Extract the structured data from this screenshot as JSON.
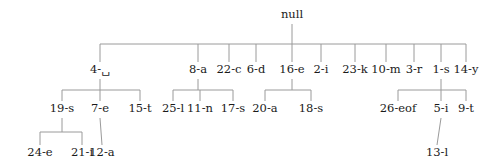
{
  "tree": {
    "line_color": "#9a9a9a",
    "text_color": "#1a1a1a",
    "root": {
      "label": "null",
      "x": 292,
      "y": 15,
      "children": [
        {
          "label": "4-␣",
          "x": 100,
          "y": 70,
          "children": [
            {
              "label": "19-s",
              "x": 62,
              "y": 109,
              "children": [
                {
                  "label": "24-e",
                  "x": 40,
                  "y": 153,
                  "children": []
                },
                {
                  "label": "21-i",
                  "x": 82,
                  "y": 153,
                  "children": []
                }
              ]
            },
            {
              "label": "7-e",
              "x": 100,
              "y": 109,
              "children": [
                {
                  "label": "12-a",
                  "x": 102,
                  "y": 153,
                  "children": []
                }
              ]
            },
            {
              "label": "15-t",
              "x": 140,
              "y": 109,
              "children": []
            }
          ]
        },
        {
          "label": "8-a",
          "x": 198,
          "y": 70,
          "children": [
            {
              "label": "25-l",
              "x": 173,
              "y": 109,
              "children": []
            },
            {
              "label": "11-n",
              "x": 200,
              "y": 109,
              "children": []
            },
            {
              "label": "17-s",
              "x": 233,
              "y": 109,
              "children": []
            }
          ]
        },
        {
          "label": "22-c",
          "x": 229,
          "y": 70,
          "children": []
        },
        {
          "label": "6-d",
          "x": 256,
          "y": 70,
          "children": []
        },
        {
          "label": "16-e",
          "x": 292,
          "y": 70,
          "children": [
            {
              "label": "20-a",
              "x": 265,
              "y": 109,
              "children": []
            },
            {
              "label": "18-s",
              "x": 311,
              "y": 109,
              "children": []
            }
          ]
        },
        {
          "label": "2-i",
          "x": 321,
          "y": 70,
          "children": []
        },
        {
          "label": "23-k",
          "x": 355,
          "y": 70,
          "children": []
        },
        {
          "label": "10-m",
          "x": 386,
          "y": 70,
          "children": []
        },
        {
          "label": "3-r",
          "x": 414,
          "y": 70,
          "children": []
        },
        {
          "label": "1-s",
          "x": 441,
          "y": 70,
          "children": [
            {
              "label": "26-eof",
              "x": 398,
              "y": 109,
              "children": []
            },
            {
              "label": "5-i",
              "x": 441,
              "y": 109,
              "children": [
                {
                  "label": "13-l",
                  "x": 437,
                  "y": 153,
                  "children": []
                }
              ]
            },
            {
              "label": "9-t",
              "x": 466,
              "y": 109,
              "children": []
            }
          ]
        },
        {
          "label": "14-y",
          "x": 466,
          "y": 70,
          "children": []
        }
      ]
    }
  }
}
